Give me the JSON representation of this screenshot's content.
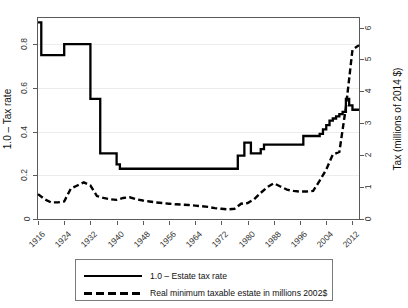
{
  "axes": {
    "ylabel_left": "1.0 – Tax rate",
    "ylabel_right": "Tax (millions of 2014 $)",
    "yticks_left": [
      "0",
      "0.2",
      "0.4",
      "0.6",
      "0.8"
    ],
    "yticks_right": [
      "0",
      "1",
      "2",
      "3",
      "4",
      "5",
      "6"
    ],
    "xticks": [
      "1916",
      "1924",
      "1932",
      "1940",
      "1948",
      "1956",
      "1964",
      "1972",
      "1980",
      "1988",
      "1996",
      "2004",
      "2012"
    ]
  },
  "legend": {
    "items": [
      {
        "label": "1.0 – Estate tax rate",
        "style": "solid",
        "key_name": "solid-line-key"
      },
      {
        "label": "Real minimum taxable estate in millions 2002$",
        "style": "dashed",
        "key_name": "dashed-line-key"
      }
    ]
  },
  "chart_data": {
    "type": "line",
    "title": "",
    "xlabel": "",
    "ylabel": "1.0 – Tax rate",
    "ylabel_secondary": "Tax (millions of 2014 $)",
    "xlim": [
      1916,
      2014
    ],
    "ylim": [
      0,
      0.92
    ],
    "ylim_secondary": [
      0,
      6.3
    ],
    "grid": true,
    "legend_position": "below-axes",
    "series": [
      {
        "name": "1.0 – Estate tax rate",
        "axis": "left",
        "style": "solid",
        "color": "#000000",
        "step": true,
        "x": [
          1916,
          1917,
          1918,
          1919,
          1920,
          1921,
          1922,
          1923,
          1924,
          1925,
          1926,
          1927,
          1928,
          1929,
          1930,
          1931,
          1932,
          1933,
          1934,
          1935,
          1936,
          1937,
          1938,
          1939,
          1940,
          1941,
          1942,
          1943,
          1944,
          1945,
          1946,
          1947,
          1948,
          1949,
          1950,
          1951,
          1952,
          1953,
          1954,
          1955,
          1956,
          1957,
          1958,
          1959,
          1960,
          1961,
          1962,
          1963,
          1964,
          1965,
          1966,
          1967,
          1968,
          1969,
          1970,
          1971,
          1972,
          1973,
          1974,
          1975,
          1976,
          1977,
          1978,
          1979,
          1980,
          1981,
          1982,
          1983,
          1984,
          1985,
          1986,
          1987,
          1988,
          1989,
          1990,
          1991,
          1992,
          1993,
          1994,
          1995,
          1996,
          1997,
          1998,
          1999,
          2000,
          2001,
          2002,
          2003,
          2004,
          2005,
          2006,
          2007,
          2008,
          2009,
          2010,
          2011,
          2012,
          2013,
          2014
        ],
        "y": [
          0.9,
          0.75,
          0.75,
          0.75,
          0.75,
          0.75,
          0.75,
          0.75,
          0.8,
          0.8,
          0.8,
          0.8,
          0.8,
          0.8,
          0.8,
          0.8,
          0.55,
          0.55,
          0.55,
          0.3,
          0.3,
          0.3,
          0.3,
          0.3,
          0.25,
          0.23,
          0.23,
          0.23,
          0.23,
          0.23,
          0.23,
          0.23,
          0.23,
          0.23,
          0.23,
          0.23,
          0.23,
          0.23,
          0.23,
          0.23,
          0.23,
          0.23,
          0.23,
          0.23,
          0.23,
          0.23,
          0.23,
          0.23,
          0.23,
          0.23,
          0.23,
          0.23,
          0.23,
          0.23,
          0.23,
          0.23,
          0.23,
          0.23,
          0.23,
          0.23,
          0.23,
          0.29,
          0.29,
          0.35,
          0.35,
          0.3,
          0.3,
          0.3,
          0.32,
          0.34,
          0.34,
          0.34,
          0.34,
          0.34,
          0.34,
          0.34,
          0.34,
          0.34,
          0.34,
          0.34,
          0.34,
          0.38,
          0.38,
          0.38,
          0.38,
          0.38,
          0.39,
          0.41,
          0.43,
          0.45,
          0.46,
          0.47,
          0.48,
          0.49,
          0.55,
          0.52,
          0.5,
          0.5,
          0.5
        ]
      },
      {
        "name": "Real minimum taxable estate in millions 2002$",
        "axis": "right",
        "style": "dashed",
        "color": "#000000",
        "step": false,
        "x": [
          1916,
          1918,
          1920,
          1922,
          1924,
          1926,
          1928,
          1930,
          1932,
          1934,
          1936,
          1938,
          1940,
          1942,
          1944,
          1946,
          1948,
          1950,
          1952,
          1954,
          1956,
          1958,
          1960,
          1962,
          1964,
          1966,
          1968,
          1970,
          1972,
          1974,
          1976,
          1978,
          1980,
          1982,
          1984,
          1986,
          1988,
          1990,
          1992,
          1994,
          1996,
          1998,
          2000,
          2002,
          2004,
          2006,
          2008,
          2010,
          2012,
          2014
        ],
        "y": [
          0.78,
          0.62,
          0.52,
          0.52,
          0.55,
          0.95,
          1.05,
          1.15,
          1.05,
          0.72,
          0.66,
          0.62,
          0.6,
          0.66,
          0.68,
          0.62,
          0.58,
          0.55,
          0.52,
          0.5,
          0.48,
          0.46,
          0.45,
          0.44,
          0.42,
          0.4,
          0.38,
          0.34,
          0.32,
          0.3,
          0.32,
          0.48,
          0.5,
          0.62,
          0.82,
          1.0,
          1.12,
          1.02,
          0.92,
          0.88,
          0.86,
          0.86,
          0.88,
          1.2,
          1.55,
          2.02,
          2.1,
          3.5,
          5.3,
          5.45
        ]
      }
    ]
  }
}
